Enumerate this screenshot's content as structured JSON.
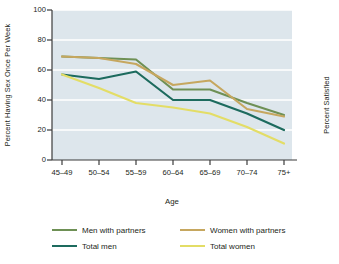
{
  "chart_data": {
    "type": "line",
    "title": "",
    "xlabel": "Age",
    "ylabel": "Percent Having Sex Once Per Week",
    "ylabel_right": "Percent Satisfied",
    "categories": [
      "45–49",
      "50–54",
      "55–59",
      "60–64",
      "65–69",
      "70–74",
      "75+"
    ],
    "ylim": [
      0,
      100
    ],
    "yticks": [
      0,
      20,
      40,
      60,
      80,
      100
    ],
    "grid": true,
    "legend_position": "bottom",
    "series": [
      {
        "name": "Men with partners",
        "color": "#6e9055",
        "values": [
          69,
          68,
          67,
          47,
          47,
          38,
          30
        ]
      },
      {
        "name": "Total men",
        "color": "#1d6b5e",
        "values": [
          57,
          54,
          59,
          40,
          40,
          31,
          20
        ]
      },
      {
        "name": "Women with partners",
        "color": "#c6a75f",
        "values": [
          69,
          68,
          64,
          50,
          53,
          34,
          29
        ]
      },
      {
        "name": "Total women",
        "color": "#e3dd66",
        "values": [
          57,
          48,
          38,
          35,
          31,
          22,
          11
        ]
      }
    ]
  },
  "axes": {
    "y_tick_labels": [
      "100",
      "80",
      "60",
      "40",
      "20",
      "0"
    ],
    "x_tick_labels": [
      "45–49",
      "50–54",
      "55–59",
      "60–64",
      "65–69",
      "70–74",
      "75+"
    ],
    "x_title": "Age",
    "y_title_left": "Percent Having Sex Once Per Week",
    "y_title_right": "Percent Satisfied"
  },
  "legend": {
    "entries": [
      {
        "label": "Men with partners",
        "color": "#6e9055"
      },
      {
        "label": "Women with partners",
        "color": "#c6a75f"
      },
      {
        "label": "Total men",
        "color": "#1d6b5e"
      },
      {
        "label": "Total women",
        "color": "#e3dd66"
      }
    ]
  },
  "colors": {
    "plot_background": "#dde6ec",
    "gridline": "#ffffff",
    "axis": "#3b3b3b",
    "text": "#231f20"
  }
}
